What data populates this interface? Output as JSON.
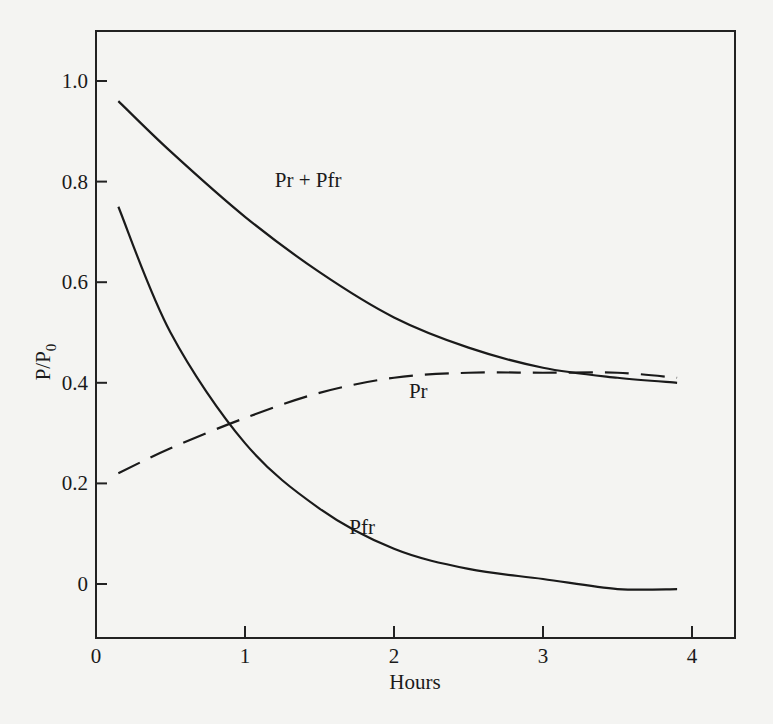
{
  "chart_data": {
    "type": "line",
    "title": "",
    "xlabel": "Hours",
    "ylabel": "P/P",
    "ylabel_subscript": "0",
    "xlim": [
      0,
      4.3
    ],
    "ylim": [
      -0.08,
      1.1
    ],
    "xticks": [
      "0",
      "1",
      "2",
      "3",
      "4"
    ],
    "yticks": [
      "0",
      "0.2",
      "0.4",
      "0.6",
      "0.8",
      "1.0"
    ],
    "grid": false,
    "legend": "inline labels",
    "series": [
      {
        "name": "Pr + Pfr",
        "style": "solid",
        "x": [
          0.15,
          0.5,
          1.0,
          1.5,
          2.0,
          2.5,
          3.0,
          3.5,
          3.9
        ],
        "y": [
          0.96,
          0.86,
          0.73,
          0.62,
          0.53,
          0.47,
          0.43,
          0.41,
          0.4
        ]
      },
      {
        "name": "Pr",
        "style": "dashed",
        "x": [
          0.15,
          0.5,
          1.0,
          1.5,
          2.0,
          2.5,
          3.0,
          3.5,
          3.9
        ],
        "y": [
          0.22,
          0.27,
          0.33,
          0.38,
          0.41,
          0.42,
          0.42,
          0.42,
          0.41
        ]
      },
      {
        "name": "Pfr",
        "style": "solid",
        "x": [
          0.15,
          0.5,
          1.0,
          1.5,
          2.0,
          2.5,
          3.0,
          3.5,
          3.9
        ],
        "y": [
          0.75,
          0.5,
          0.28,
          0.15,
          0.07,
          0.03,
          0.01,
          -0.01,
          -0.01
        ]
      }
    ],
    "annotations": [
      {
        "text": "Pr + Pfr",
        "x": 1.2,
        "y": 0.79
      },
      {
        "text": "Pr",
        "x": 2.1,
        "y": 0.37
      },
      {
        "text": "Pfr",
        "x": 1.7,
        "y": 0.1
      }
    ]
  }
}
